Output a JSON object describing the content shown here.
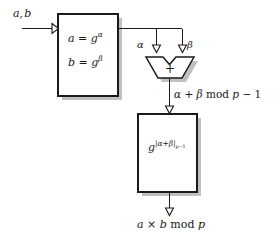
{
  "figure": {
    "type": "dataflow-diagram",
    "width": 276,
    "height": 240,
    "background_color": "#ffffff",
    "line_color": "#1a1a1a",
    "shadow_color": "#b8b8b8",
    "box_fill": "#ffffff"
  },
  "labels": {
    "input": "a, b",
    "box1_line1_lhs": "a",
    "box1_line1_eq": " = ",
    "box1_line1_base": "g",
    "box1_line1_exp": "α",
    "box1_line2_lhs": "b",
    "box1_line2_eq": " = ",
    "box1_line2_base": "g",
    "box1_line2_exp": "β",
    "wire_left": "α",
    "wire_right": "β",
    "adder_symbol": "+",
    "sum_expr": "α + β mod p − 1",
    "sum_alpha": "α",
    "sum_plus": " + ",
    "sum_beta": "β",
    "sum_mod": " mod ",
    "sum_p": "p",
    "sum_minus_one": " − 1",
    "box2_base": "g",
    "box2_exp": "|α+β|",
    "box2_exp_sub": "p−1",
    "output": "a × b mod p",
    "output_a": "a",
    "output_times": " × ",
    "output_b": "b",
    "output_mod": " mod ",
    "output_p": "p"
  },
  "nodes": [
    {
      "id": "box-exponentiation-pair",
      "shape": "rectangle",
      "x": 58,
      "y": 14,
      "width": 60,
      "height": 82,
      "content": [
        "a = g^α",
        "b = g^β"
      ],
      "has_shadow": true
    },
    {
      "id": "adder",
      "shape": "alu-trapezoid",
      "x": 146,
      "y": 57,
      "width": 48,
      "height": 22,
      "content": "+",
      "has_shadow": true
    },
    {
      "id": "box-exponentiation-result",
      "shape": "rectangle",
      "x": 138,
      "y": 114,
      "width": 59,
      "height": 78,
      "content": [
        "g^|α+β|_{p−1}"
      ],
      "has_shadow": true
    }
  ],
  "edges": [
    {
      "id": "edge-input-to-box1",
      "from": "input-label",
      "to": "box-exponentiation-pair",
      "label": "a, b",
      "arrowhead": "open-triangle",
      "direction": "right"
    },
    {
      "id": "edge-box1-to-adder-left",
      "from": "box-exponentiation-pair",
      "to": "adder",
      "label": "α",
      "arrowhead": "open-triangle",
      "direction": "down"
    },
    {
      "id": "edge-box1-to-adder-right",
      "from": "box-exponentiation-pair",
      "to": "adder",
      "label": "β",
      "arrowhead": "open-triangle",
      "direction": "down"
    },
    {
      "id": "edge-adder-to-box2",
      "from": "adder",
      "to": "box-exponentiation-result",
      "label": "α + β mod p − 1",
      "arrowhead": "open-triangle",
      "direction": "down"
    },
    {
      "id": "edge-box2-to-output",
      "from": "box-exponentiation-result",
      "to": "output-label",
      "label": "a × b mod p",
      "arrowhead": "open-triangle",
      "direction": "down"
    }
  ]
}
